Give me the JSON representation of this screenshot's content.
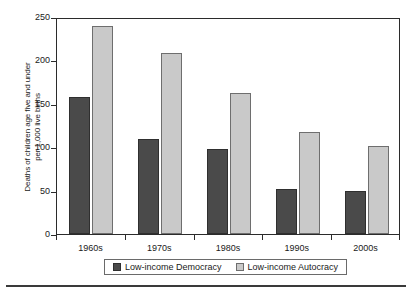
{
  "chart_data": {
    "type": "bar",
    "title": "",
    "xlabel": "",
    "ylabel": "Deaths of children age five and under per 1,000 live births",
    "ylabel_line1": "Deaths of children age five and under",
    "ylabel_line2": "per 1,000 live births",
    "categories": [
      "1960s",
      "1970s",
      "1980s",
      "1990s",
      "2000s"
    ],
    "series": [
      {
        "name": "Low-income Democracy",
        "color": "#4a4a4a",
        "values": [
          158,
          109,
          98,
          52,
          50
        ]
      },
      {
        "name": "Low-income Autocracy",
        "color": "#c9c9c9",
        "values": [
          240,
          208,
          162,
          117,
          101
        ]
      }
    ],
    "ylim": [
      0,
      250
    ],
    "yticks": [
      0,
      50,
      100,
      150,
      200,
      250
    ],
    "ytick_labels": [
      "0",
      "50",
      "100",
      "150",
      "200",
      "250"
    ],
    "grid": false,
    "legend_position": "bottom"
  },
  "legend": {
    "entries": [
      {
        "label": "Low-income Democracy",
        "swatch": "dark-swatch"
      },
      {
        "label": "Low-income Autocracy",
        "swatch": "light-swatch"
      }
    ]
  }
}
